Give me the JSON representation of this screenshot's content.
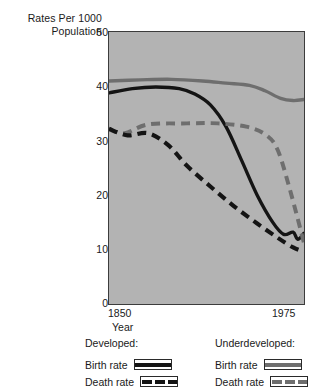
{
  "chart_data": {
    "type": "line",
    "title": "",
    "ylabel": "Rates Per 1000 Population",
    "xlabel": "Year",
    "xlim": [
      1850,
      1975
    ],
    "ylim": [
      0,
      50
    ],
    "xticks": [
      1850,
      1975
    ],
    "yticks": [
      0,
      10,
      20,
      30,
      40,
      50
    ],
    "grid": false,
    "legend_position": "below-plot",
    "plot_background": "#b3b3b3",
    "series": [
      {
        "name": "Underdeveloped: Birth rate",
        "style": "solid",
        "color": "#6e6e6e",
        "x": [
          1850,
          1870,
          1890,
          1910,
          1925,
          1940,
          1950,
          1960,
          1968,
          1975
        ],
        "values": [
          41,
          41.2,
          41.3,
          41,
          40.6,
          40.2,
          39.2,
          37.8,
          37.4,
          37.6
        ]
      },
      {
        "name": "Developed: Birth rate",
        "style": "solid",
        "color": "#141414",
        "x": [
          1850,
          1865,
          1880,
          1895,
          1905,
          1915,
          1925,
          1935,
          1945,
          1955,
          1962,
          1968,
          1971,
          1975
        ],
        "values": [
          38.8,
          39.6,
          39.9,
          39.6,
          38.6,
          36.6,
          32.6,
          26.4,
          20.0,
          15.0,
          12.8,
          13.2,
          11.9,
          13.0
        ]
      },
      {
        "name": "Underdeveloped: Death rate",
        "style": "dashed",
        "color": "#6e6e6e",
        "x": [
          1850,
          1860,
          1875,
          1900,
          1920,
          1938,
          1950,
          1958,
          1966,
          1975
        ],
        "values": [
          32.1,
          31.4,
          33.0,
          33.2,
          33.2,
          32.6,
          31.2,
          28.4,
          21.0,
          11.2
        ]
      },
      {
        "name": "Developed: Death rate",
        "style": "dashed",
        "color": "#141414",
        "x": [
          1850,
          1862,
          1875,
          1888,
          1900,
          1915,
          1930,
          1945,
          1958,
          1968,
          1975
        ],
        "values": [
          32.2,
          31.0,
          31.4,
          29.2,
          25.4,
          21.6,
          18.0,
          14.8,
          12.2,
          10.4,
          9.6
        ]
      }
    ]
  },
  "axis": {
    "y_title": "Rates Per 1000\nPopulation",
    "y_tick_labels": [
      "50",
      "40",
      "30",
      "20",
      "10",
      "0"
    ],
    "x_tick_left": "1850",
    "x_tick_right": "1975",
    "x_title": "Year"
  },
  "legend": {
    "developed": {
      "title": "Developed:",
      "birth_label": "Birth rate",
      "death_label": "Death rate",
      "birth_swatch": "solid-dark-line-icon",
      "death_swatch": "dashed-dark-line-icon"
    },
    "underdeveloped": {
      "title": "Underdeveloped:",
      "birth_label": "Birth rate",
      "death_label": "Death rate",
      "birth_swatch": "solid-gray-line-icon",
      "death_swatch": "dashed-gray-line-icon"
    }
  }
}
